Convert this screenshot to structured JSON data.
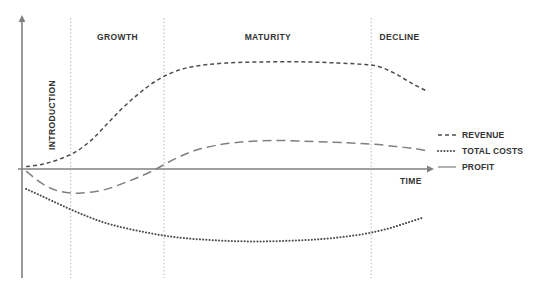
{
  "chart_data": {
    "type": "line",
    "xlabel": "TIME",
    "ylabel": "",
    "grid": false,
    "legend_position": "right",
    "x_axis_arrow": true,
    "y_axis_arrow": true,
    "zero_line": true,
    "xlim": [
      0,
      100
    ],
    "stages": [
      {
        "name": "INTRODUCTION",
        "orientation": "vertical",
        "start": 0,
        "end": 12
      },
      {
        "name": "GROWTH",
        "orientation": "horizontal",
        "start": 12,
        "end": 35
      },
      {
        "name": "MATURITY",
        "orientation": "horizontal",
        "start": 35,
        "end": 86
      },
      {
        "name": "DECLINE",
        "orientation": "horizontal",
        "start": 86,
        "end": 100
      }
    ],
    "stage_dividers": [
      12,
      35,
      86
    ],
    "series": [
      {
        "name": "REVENUE",
        "style": "dashed",
        "color": "#4d4d4d",
        "x": [
          1,
          5,
          9,
          13,
          17,
          21,
          25,
          29,
          33,
          37,
          42,
          50,
          60,
          70,
          78,
          84,
          88,
          92,
          96,
          100
        ],
        "y": [
          2,
          4,
          8,
          14,
          24,
          38,
          52,
          64,
          74,
          81,
          86,
          89,
          90,
          90,
          89,
          88,
          86,
          80,
          72,
          65
        ]
      },
      {
        "name": "TOTAL COSTS",
        "style": "dotted",
        "color": "#4d4d4d",
        "x": [
          1,
          5,
          10,
          16,
          22,
          30,
          38,
          48,
          58,
          68,
          76,
          84,
          90,
          95,
          99
        ],
        "y": [
          -19,
          -26,
          -35,
          -45,
          -53,
          -60,
          -65,
          -68,
          -69,
          -68,
          -66,
          -62,
          -57,
          -51,
          -46
        ]
      },
      {
        "name": "PROFIT",
        "style": "long-dashed",
        "color": "#808080",
        "x": [
          1,
          5,
          9,
          14,
          20,
          26,
          32,
          38,
          44,
          52,
          62,
          72,
          80,
          86,
          92,
          97,
          100
        ],
        "y": [
          -2,
          -14,
          -21,
          -23,
          -20,
          -12,
          -2,
          9,
          17,
          22,
          24,
          23,
          22,
          21,
          19,
          17,
          15
        ]
      }
    ]
  },
  "legend": {
    "items": [
      {
        "label": "REVENUE",
        "style": "dashed"
      },
      {
        "label": "TOTAL COSTS",
        "style": "dotted"
      },
      {
        "label": "PROFIT",
        "style": "solid"
      }
    ]
  },
  "colors": {
    "axis": "#808080",
    "divider": "#b3b3b3",
    "revenue": "#4d4d4d",
    "total_costs": "#4d4d4d",
    "profit": "#999999",
    "text": "#333333",
    "background": "#ffffff"
  }
}
